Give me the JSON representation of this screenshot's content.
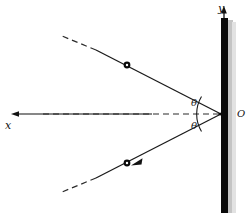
{
  "figure": {
    "type": "physics-diagram",
    "labels": {
      "y_axis": "y",
      "x_axis": "x",
      "origin": "O",
      "angle_upper": "θ",
      "angle_lower": "θ"
    },
    "caption": "",
    "colors": {
      "wall": "#0a0a0a",
      "wall_shadow": "#b8b8b8",
      "line": "#1a1a1a",
      "dash": "#2b2b2b",
      "particle": "#0a0a0a",
      "background": "#ffffff"
    },
    "geometry": {
      "origin_point": [
        221,
        114
      ],
      "wall_x": 221,
      "wall_top": 18,
      "wall_bottom": 213,
      "wall_width": 7,
      "y_axis_arrow_tip": [
        222,
        8
      ],
      "x_axis_arrow_tip": [
        12,
        114
      ],
      "x_axis_tail": [
        152,
        114
      ],
      "upper_ray_end": [
        96,
        50
      ],
      "lower_ray_end": [
        96,
        178
      ],
      "upper_particle": [
        127,
        65
      ],
      "lower_particle": [
        127,
        163
      ],
      "upper_dash_end": [
        62,
        36
      ],
      "lower_dash_end": [
        62,
        192
      ],
      "arc_radius": 34
    }
  }
}
